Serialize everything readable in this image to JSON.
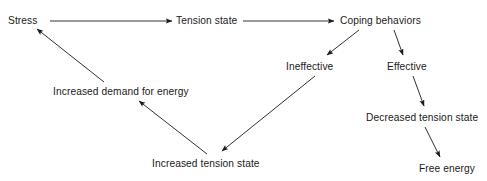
{
  "diagram": {
    "type": "flowchart",
    "background_color": "#ffffff",
    "line_color": "#1a1a1a",
    "text_color": "#1a1a1a",
    "nodes": [
      {
        "id": "stress",
        "label": "Stress",
        "x": 8,
        "y": 14
      },
      {
        "id": "tension-state",
        "label": "Tension state",
        "x": 176,
        "y": 14
      },
      {
        "id": "coping-behaviors",
        "label": "Coping behaviors",
        "x": 340,
        "y": 14
      },
      {
        "id": "ineffective",
        "label": "Ineffective",
        "x": 286,
        "y": 60
      },
      {
        "id": "effective",
        "label": "Effective",
        "x": 387,
        "y": 60
      },
      {
        "id": "increased-demand",
        "label": "Increased demand for energy",
        "x": 53,
        "y": 85
      },
      {
        "id": "decreased-tension",
        "label": "Decreased tension state",
        "x": 366,
        "y": 111
      },
      {
        "id": "increased-tension",
        "label": "Increased tension state",
        "x": 152,
        "y": 157
      },
      {
        "id": "free-energy",
        "label": "Free energy",
        "x": 419,
        "y": 162
      }
    ],
    "edges": [
      {
        "id": "stress-to-tension",
        "from": "stress",
        "to": "tension-state",
        "x1": 50,
        "y1": 21,
        "x2": 172,
        "y2": 21
      },
      {
        "id": "tension-to-coping",
        "from": "tension-state",
        "to": "coping-behaviors",
        "x1": 243,
        "y1": 21,
        "x2": 334,
        "y2": 21
      },
      {
        "id": "coping-to-ineffective",
        "from": "coping-behaviors",
        "to": "ineffective",
        "x1": 359,
        "y1": 30,
        "x2": 327,
        "y2": 55
      },
      {
        "id": "coping-to-effective",
        "from": "coping-behaviors",
        "to": "effective",
        "x1": 394,
        "y1": 30,
        "x2": 403,
        "y2": 55
      },
      {
        "id": "ineffective-to-increased",
        "from": "ineffective",
        "to": "increased-tension",
        "x1": 315,
        "y1": 76,
        "x2": 222,
        "y2": 151
      },
      {
        "id": "increased-to-demand",
        "from": "increased-tension",
        "to": "increased-demand",
        "x1": 207,
        "y1": 154,
        "x2": 139,
        "y2": 101
      },
      {
        "id": "demand-to-stress",
        "from": "increased-demand",
        "to": "stress",
        "x1": 104,
        "y1": 82,
        "x2": 37,
        "y2": 29
      },
      {
        "id": "effective-to-decreased",
        "from": "effective",
        "to": "decreased-tension",
        "x1": 413,
        "y1": 76,
        "x2": 424,
        "y2": 106
      },
      {
        "id": "decreased-to-free-energy",
        "from": "decreased-tension",
        "to": "free-energy",
        "x1": 425,
        "y1": 127,
        "x2": 440,
        "y2": 157
      }
    ]
  }
}
